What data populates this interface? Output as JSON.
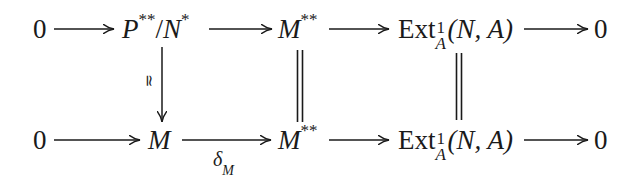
{
  "diagram": {
    "type": "commutative-diagram",
    "top_row": {
      "n0": "0",
      "n1": {
        "base": "P",
        "sup": "**",
        "slash": "/",
        "base2": "N",
        "sup2": "*"
      },
      "n2": {
        "base": "M",
        "sup": "**"
      },
      "n3": {
        "op": "Ext",
        "sup": "1",
        "sub": "A",
        "args": "(N, A)"
      },
      "n4": "0"
    },
    "bottom_row": {
      "n0": "0",
      "n1": {
        "base": "M"
      },
      "n2": {
        "base": "M",
        "sup": "**"
      },
      "n3": {
        "op": "Ext",
        "sup": "1",
        "sub": "A",
        "args": "(N, A)"
      },
      "n4": "0"
    },
    "labels": {
      "iso": "≃",
      "delta": {
        "base": "δ",
        "sub": "M"
      }
    },
    "vertical_maps": [
      {
        "from": "P**/N*",
        "to": "M",
        "kind": "arrow",
        "label": "≃"
      },
      {
        "from": "M**",
        "to": "M**",
        "kind": "equality"
      },
      {
        "from": "Ext^1_A(N,A)",
        "to": "Ext^1_A(N,A)",
        "kind": "equality"
      }
    ],
    "horizontal_maps": [
      {
        "row": "top",
        "from": "0",
        "to": "P**/N*"
      },
      {
        "row": "top",
        "from": "P**/N*",
        "to": "M**"
      },
      {
        "row": "top",
        "from": "M**",
        "to": "Ext^1_A(N,A)"
      },
      {
        "row": "top",
        "from": "Ext^1_A(N,A)",
        "to": "0"
      },
      {
        "row": "bottom",
        "from": "0",
        "to": "M"
      },
      {
        "row": "bottom",
        "from": "M",
        "to": "M**",
        "label": "δ_M"
      },
      {
        "row": "bottom",
        "from": "M**",
        "to": "Ext^1_A(N,A)"
      },
      {
        "row": "bottom",
        "from": "Ext^1_A(N,A)",
        "to": "0"
      }
    ]
  }
}
